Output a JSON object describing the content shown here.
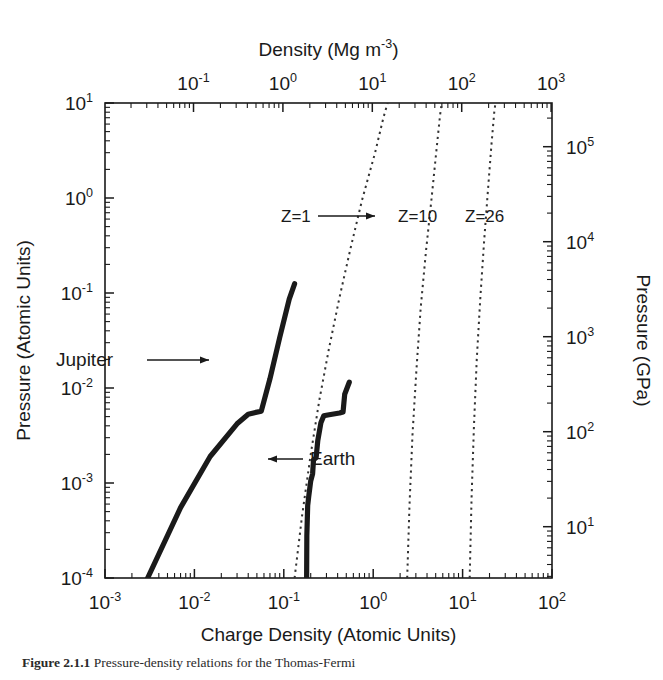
{
  "figure": {
    "caption_label": "Figure 2.1.1",
    "caption_text": "Pressure-density relations for the Thomas-Fermi"
  },
  "axes": {
    "bottom": {
      "title": "Charge Density (Atomic Units)",
      "ticks": [
        {
          "mant": "10",
          "exp": "-3",
          "value": -3
        },
        {
          "mant": "10",
          "exp": "-2",
          "value": -2
        },
        {
          "mant": "10",
          "exp": "-1",
          "value": -1
        },
        {
          "mant": "10",
          "exp": "0",
          "value": 0
        },
        {
          "mant": "10",
          "exp": "1",
          "value": 1
        },
        {
          "mant": "10",
          "exp": "2",
          "value": 2
        }
      ],
      "range": [
        -3,
        2
      ]
    },
    "top": {
      "title": "Density (Mg m",
      "title_exp": "-3",
      "title_tail": ")",
      "ticks": [
        {
          "mant": "10",
          "exp": "-1",
          "value": -1
        },
        {
          "mant": "10",
          "exp": "0",
          "value": 0
        },
        {
          "mant": "10",
          "exp": "1",
          "value": 1
        },
        {
          "mant": "10",
          "exp": "2",
          "value": 2
        },
        {
          "mant": "10",
          "exp": "3",
          "value": 3
        }
      ],
      "range": [
        -1.99,
        3.01
      ]
    },
    "left": {
      "title": "Pressure (Atomic Units)",
      "ticks": [
        {
          "mant": "10",
          "exp": "1",
          "value": 1
        },
        {
          "mant": "10",
          "exp": "0",
          "value": 0
        },
        {
          "mant": "10",
          "exp": "-1",
          "value": -1
        },
        {
          "mant": "10",
          "exp": "-2",
          "value": -2
        },
        {
          "mant": "10",
          "exp": "-3",
          "value": -3
        },
        {
          "mant": "10",
          "exp": "-4",
          "value": -4
        }
      ],
      "range": [
        -4,
        1
      ]
    },
    "right": {
      "title": "Pressure (GPa)",
      "ticks": [
        {
          "mant": "10",
          "exp": "5",
          "value": 5
        },
        {
          "mant": "10",
          "exp": "4",
          "value": 4
        },
        {
          "mant": "10",
          "exp": "3",
          "value": 3
        },
        {
          "mant": "10",
          "exp": "2",
          "value": 2
        },
        {
          "mant": "10",
          "exp": "1",
          "value": 1
        }
      ],
      "range": [
        0.46,
        5.46
      ]
    }
  },
  "annotations": {
    "jupiter": "Jupiter",
    "earth": "Earth",
    "z1": "Z=1",
    "z10": "Z=10",
    "z26": "Z=26"
  },
  "colors": {
    "ink": "#1a1a1a",
    "curve": "#111111",
    "dotted": "#333333",
    "background": "#ffffff"
  },
  "chart_data": {
    "type": "line",
    "title": "",
    "xlabel": "Charge Density (Atomic Units)",
    "ylabel": "Pressure (Atomic Units)",
    "xlabel_secondary": "Density (Mg m-3)",
    "ylabel_secondary": "Pressure (GPa)",
    "xscale": "log",
    "yscale": "log",
    "xlim": [
      0.001,
      100
    ],
    "ylim": [
      0.0001,
      10
    ],
    "xlim_top": [
      0.0102,
      1023
    ],
    "ylim_right": [
      2.9,
      288000
    ],
    "grid": false,
    "legend": "inline-labels",
    "series": [
      {
        "name": "Jupiter",
        "style": "solid-thick",
        "label": "Jupiter",
        "points": [
          [
            0.003,
            0.0001
          ],
          [
            0.007,
            0.00055
          ],
          [
            0.015,
            0.0019
          ],
          [
            0.03,
            0.0042
          ],
          [
            0.04,
            0.0053
          ],
          [
            0.047,
            0.0055
          ],
          [
            0.056,
            0.0057
          ],
          [
            0.07,
            0.0125
          ],
          [
            0.09,
            0.034
          ],
          [
            0.115,
            0.086
          ],
          [
            0.132,
            0.125
          ]
        ]
      },
      {
        "name": "Earth",
        "style": "solid-thick",
        "label": "Earth",
        "points": [
          [
            0.18,
            0.0001
          ],
          [
            0.181,
            0.00028
          ],
          [
            0.185,
            0.00058
          ],
          [
            0.19,
            0.00072
          ],
          [
            0.2,
            0.00105
          ],
          [
            0.21,
            0.00125
          ],
          [
            0.215,
            0.00175
          ],
          [
            0.23,
            0.00185
          ],
          [
            0.24,
            0.0028
          ],
          [
            0.26,
            0.0043
          ],
          [
            0.28,
            0.0051
          ],
          [
            0.31,
            0.0052
          ],
          [
            0.42,
            0.00545
          ],
          [
            0.46,
            0.0056
          ],
          [
            0.48,
            0.0086
          ],
          [
            0.54,
            0.0115
          ]
        ]
      },
      {
        "name": "Z=1",
        "style": "dotted",
        "label": "Z=1",
        "points": [
          [
            0.132,
            0.0001
          ],
          [
            0.16,
            0.00045
          ],
          [
            0.2,
            0.002
          ],
          [
            0.25,
            0.0075
          ],
          [
            0.32,
            0.026
          ],
          [
            0.42,
            0.09
          ],
          [
            0.56,
            0.3
          ],
          [
            0.75,
            0.95
          ],
          [
            1.05,
            3.0
          ],
          [
            1.3,
            7.0
          ],
          [
            1.45,
            10.0
          ]
        ]
      },
      {
        "name": "Z=10",
        "style": "dotted",
        "label": "Z=10",
        "points": [
          [
            2.4,
            0.0001
          ],
          [
            2.55,
            0.0006
          ],
          [
            2.75,
            0.0032
          ],
          [
            3.05,
            0.016
          ],
          [
            3.4,
            0.07
          ],
          [
            3.9,
            0.28
          ],
          [
            4.5,
            1.0
          ],
          [
            5.1,
            3.2
          ],
          [
            5.6,
            7.5
          ],
          [
            5.85,
            10.0
          ]
        ]
      },
      {
        "name": "Z=26",
        "style": "dotted",
        "label": "Z=26",
        "points": [
          [
            12.0,
            0.0001
          ],
          [
            12.6,
            0.0007
          ],
          [
            13.4,
            0.004
          ],
          [
            14.4,
            0.02
          ],
          [
            15.8,
            0.09
          ],
          [
            17.4,
            0.35
          ],
          [
            19.2,
            1.2
          ],
          [
            21.0,
            3.6
          ],
          [
            22.6,
            8.0
          ],
          [
            23.3,
            10.0
          ]
        ]
      }
    ]
  }
}
